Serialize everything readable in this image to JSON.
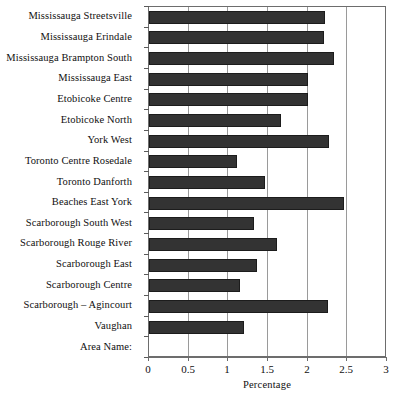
{
  "chart_data": {
    "type": "bar",
    "orientation": "horizontal",
    "title": "",
    "xlabel": "Percentage",
    "ylabel": "",
    "xlim": [
      0,
      3
    ],
    "xticks": [
      "0",
      "0.5",
      "1",
      "1.5",
      "2",
      "2.5",
      "3"
    ],
    "xtick_values": [
      0,
      0.5,
      1,
      1.5,
      2,
      2.5,
      3
    ],
    "grid": true,
    "grid_axis": "x",
    "legend": null,
    "bar_color": "#333333",
    "gridline_color": "#9a9a9a",
    "axis_color": "#6d6d6d",
    "categories": [
      "Mississauga Streetsville",
      "Mississauga Erindale",
      "Mississauga Brampton South",
      "Mississauga East",
      "Etobicoke Centre",
      "Etobicoke North",
      "York West",
      "Toronto Centre Rosedale",
      "Toronto Danforth",
      "Beaches East York",
      "Scarborough South West",
      "Scarborough Rouge River",
      "Scarborough East",
      "Scarborough Centre",
      "Scarborough – Agincourt",
      "Vaughan",
      "Area Name:"
    ],
    "values": [
      2.22,
      2.21,
      2.33,
      2.0,
      2.0,
      1.67,
      2.27,
      1.11,
      1.46,
      2.46,
      1.32,
      1.61,
      1.36,
      1.15,
      2.25,
      1.2,
      0
    ]
  }
}
